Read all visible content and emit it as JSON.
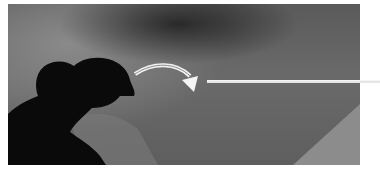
{
  "figure": {
    "colors": {
      "background": "#646464",
      "silhouette": "#0a0a0a",
      "light_wedge": "#8c8c8c",
      "arrow": "#f2f2f2",
      "leader_line": "#e6e6e6"
    }
  }
}
